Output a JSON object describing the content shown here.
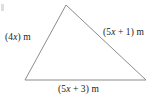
{
  "figure": {
    "type": "triangle-diagram",
    "shape": "triangle",
    "units": "m",
    "stroke_color": "#8c8c8c",
    "background_color": "#ffffff",
    "text_color": "#1a1a1a",
    "vertices": {
      "apex": [
        66,
        5
      ],
      "bottom_left": [
        25,
        80
      ],
      "bottom_right": [
        146,
        80
      ]
    },
    "labels": {
      "left_side": {
        "prefix": "(4",
        "variable": "x",
        "suffix": ") m",
        "full": "(4x) m"
      },
      "right_side": {
        "prefix": "(5",
        "variable": "x",
        "suffix": " + 1) m",
        "full": "(5x + 1) m"
      },
      "bottom_side": {
        "prefix": "(5",
        "variable": "x",
        "suffix": " + 3) m",
        "full": "(5x + 3) m"
      }
    }
  }
}
